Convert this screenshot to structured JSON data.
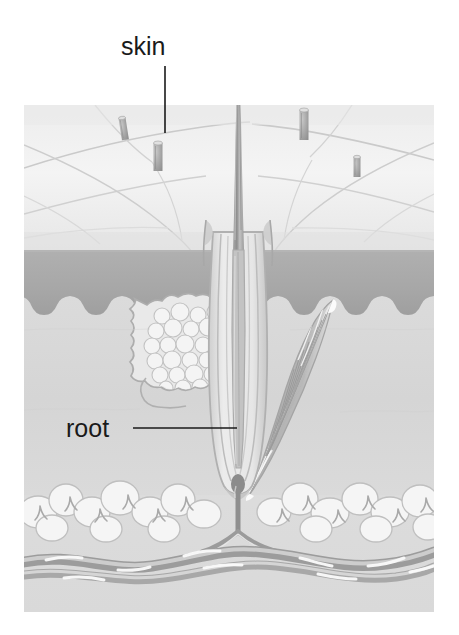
{
  "figure": {
    "background_color": "#ffffff"
  },
  "labels": [
    {
      "id": "skin",
      "text": "skin",
      "text_x": 121,
      "text_y": 55,
      "leader": {
        "x1": 165,
        "y1": 66,
        "x2": 165,
        "y2": 133
      }
    },
    {
      "id": "root",
      "text": "root",
      "text_x": 66,
      "text_y": 437,
      "leader": {
        "x1": 133,
        "y1": 428,
        "x2": 237,
        "y2": 428
      }
    }
  ],
  "colors": {
    "line": "#1a1a1a",
    "skin_surface": "#f1f1f1",
    "skin_surface_shade": "#e3e3e3",
    "epidermis": "#a9a9a9",
    "epidermis_dark": "#9a9a9a",
    "dermis": "#d6d6d6",
    "dermis_light": "#dedede",
    "subcutis": "#dcdcdc",
    "fat_lobule": "#f4f4f4",
    "fat_outline": "#b8b8b8",
    "vessel": "#9d9d9d",
    "vessel_light": "#f0f0f0",
    "hair_shaft": "#9c9c9c",
    "hair_shaft_light": "#c9c9c9",
    "follicle_wall": "#b5b5b5",
    "follicle_inner": "#e8e8e8",
    "gland_fill": "#e7e7e7",
    "gland_outline": "#b0b0b0",
    "gland_cell": "#f2f2f2",
    "muscle": "#b9b9b9",
    "muscle_light": "#f0f0f0",
    "papilla": "#8e8e8e",
    "crease": "#c7c7c7",
    "stub": "#a5a5a5",
    "stub_top": "#dcdcdc"
  },
  "illustration_bounds": {
    "x": 24,
    "y": 105,
    "width": 410,
    "height": 507
  },
  "layers": [
    {
      "id": "skin-surface",
      "name": "skin surface",
      "top": 105,
      "bottom": 245
    },
    {
      "id": "epidermis",
      "name": "epidermis band",
      "top": 245,
      "bottom": 310
    },
    {
      "id": "dermis",
      "name": "dermis",
      "top": 300,
      "bottom": 485
    },
    {
      "id": "subcutis",
      "name": "subcutaneous fat",
      "top": 485,
      "bottom": 612
    }
  ],
  "structures": [
    {
      "id": "hair-shaft",
      "name": "hair shaft",
      "tip_y": 35,
      "base_y": 500,
      "x": 238
    },
    {
      "id": "hair-follicle",
      "name": "hair follicle",
      "x": 238,
      "top": 232,
      "bottom": 500
    },
    {
      "id": "sebaceous-gland",
      "name": "sebaceous gland",
      "cx": 180,
      "cy": 348
    },
    {
      "id": "arrector-pili-muscle",
      "name": "arrector pili muscle",
      "top": 300,
      "bottom": 495
    },
    {
      "id": "dermal-papilla",
      "name": "dermal papilla",
      "cx": 238,
      "cy": 487
    },
    {
      "id": "blood-vessels",
      "name": "blood vessels",
      "y": 555
    }
  ],
  "hair_stubs": [
    {
      "id": "stub-1",
      "x": 122,
      "y": 118,
      "width": 7,
      "height": 22,
      "tilt": -10
    },
    {
      "id": "stub-2",
      "x": 157,
      "y": 143,
      "width": 9,
      "height": 28,
      "tilt": 0
    },
    {
      "id": "stub-3",
      "x": 303,
      "y": 110,
      "width": 9,
      "height": 30,
      "tilt": 0
    },
    {
      "id": "stub-4",
      "x": 356,
      "y": 157,
      "width": 7,
      "height": 20,
      "tilt": 0
    }
  ]
}
